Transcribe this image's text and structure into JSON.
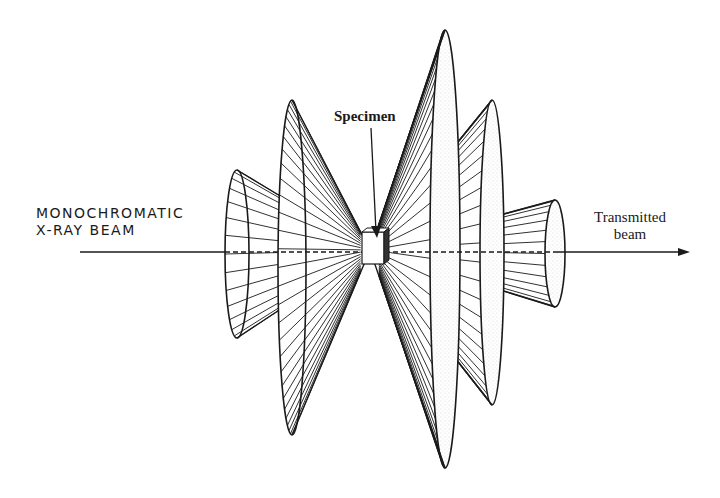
{
  "figure": {
    "labels": {
      "incident_line1": "MONOCHROMATIC",
      "incident_line2": "X-RAY BEAM",
      "specimen": "Specimen",
      "transmitted_line1": "Transmitted",
      "transmitted_line2": "beam"
    },
    "beam": {
      "y": 252,
      "x_start": 80,
      "x_end": 690
    },
    "specimen_position": {
      "x": 370,
      "y": 250
    },
    "cones": [
      {
        "id": "backscatter-1",
        "direction": "backward",
        "base_x": 237,
        "base_top": 170,
        "base_bottom": 338,
        "rx": 12
      },
      {
        "id": "backscatter-2",
        "direction": "backward",
        "base_x": 292,
        "base_top": 100,
        "base_bottom": 435,
        "rx": 14
      },
      {
        "id": "forward-1",
        "direction": "forward",
        "base_x": 445,
        "base_top": 30,
        "base_bottom": 468,
        "rx": 15
      },
      {
        "id": "forward-2",
        "direction": "forward",
        "base_x": 492,
        "base_top": 100,
        "base_bottom": 405,
        "rx": 12
      },
      {
        "id": "forward-3",
        "direction": "forward",
        "base_x": 555,
        "base_top": 200,
        "base_bottom": 307,
        "rx": 10
      }
    ],
    "colors": {
      "ink": "#1a1a1a",
      "background": "#ffffff",
      "stipple": "#c8c8c8"
    }
  }
}
